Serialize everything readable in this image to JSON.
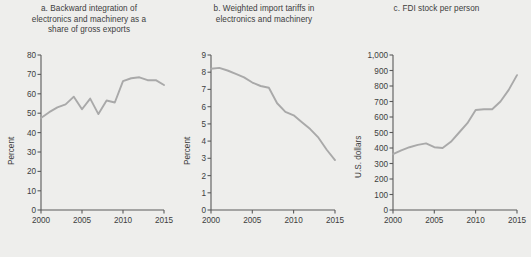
{
  "figure": {
    "background_color": "#eeeeec",
    "line_color": "#a9a9a9",
    "axis_color": "#5a5a5a",
    "text_color": "#3d3d3d"
  },
  "panels": [
    {
      "key": "a",
      "title": "a. Backward integration of electronics and machinery as a share of gross exports",
      "title_lines": [
        "a. Backward integration of",
        "electronics and machinery as a",
        "share of gross exports"
      ],
      "ylabel": "Percent",
      "yticks": [
        "80",
        "70",
        "60",
        "50",
        "40",
        "30",
        "20",
        "10",
        "0"
      ],
      "xticks": [
        "2000",
        "2005",
        "2010",
        "2015"
      ]
    },
    {
      "key": "b",
      "title": "b. Weighted import tariffs in electronics and machinery",
      "title_lines": [
        "b. Weighted import tariffs in",
        "electronics and machinery"
      ],
      "ylabel": "Percent",
      "yticks": [
        "9",
        "8",
        "7",
        "6",
        "5",
        "4",
        "3",
        "2",
        "1",
        "0"
      ],
      "xticks": [
        "2000",
        "2005",
        "2010",
        "2015"
      ]
    },
    {
      "key": "c",
      "title": "c. FDI stock per person",
      "title_lines": [
        "c. FDI stock per person"
      ],
      "ylabel": "U.S. dollars",
      "yticks": [
        "1,000",
        "900",
        "800",
        "700",
        "600",
        "500",
        "400",
        "300",
        "200",
        "100",
        "0"
      ],
      "xticks": [
        "2000",
        "2005",
        "2010",
        "2015"
      ]
    }
  ],
  "chart_data": [
    {
      "type": "line",
      "title": "a. Backward integration of electronics and machinery as a share of gross exports",
      "xlabel": "",
      "ylabel": "Percent",
      "ylim": [
        0,
        80
      ],
      "xlim": [
        2000,
        2015
      ],
      "ytick_step": 10,
      "xticks": [
        2000,
        2005,
        2010,
        2015
      ],
      "grid": false,
      "legend": "none",
      "x": [
        2000,
        2001,
        2002,
        2003,
        2004,
        2005,
        2006,
        2007,
        2008,
        2009,
        2010,
        2011,
        2012,
        2013,
        2014,
        2015
      ],
      "series": [
        {
          "name": "Backward integration share",
          "values": [
            47.5,
            50.5,
            53.0,
            54.5,
            58.5,
            52.0,
            57.5,
            49.5,
            56.5,
            55.5,
            66.5,
            68.0,
            68.5,
            67.0,
            67.0,
            64.5
          ]
        }
      ]
    },
    {
      "type": "line",
      "title": "b. Weighted import tariffs in electronics and machinery",
      "xlabel": "",
      "ylabel": "Percent",
      "ylim": [
        0,
        9
      ],
      "xlim": [
        2000,
        2015
      ],
      "ytick_step": 1,
      "xticks": [
        2000,
        2005,
        2010,
        2015
      ],
      "grid": false,
      "legend": "none",
      "x": [
        2000,
        2001,
        2002,
        2003,
        2004,
        2005,
        2006,
        2007,
        2008,
        2009,
        2010,
        2011,
        2012,
        2013,
        2014,
        2015
      ],
      "series": [
        {
          "name": "Weighted import tariff",
          "values": [
            8.2,
            8.25,
            8.1,
            7.9,
            7.7,
            7.4,
            7.2,
            7.1,
            6.2,
            5.7,
            5.5,
            5.1,
            4.7,
            4.2,
            3.5,
            2.9
          ]
        }
      ]
    },
    {
      "type": "line",
      "title": "c. FDI stock per person",
      "xlabel": "",
      "ylabel": "U.S. dollars",
      "ylim": [
        0,
        1000
      ],
      "xlim": [
        2000,
        2015
      ],
      "ytick_step": 100,
      "xticks": [
        2000,
        2005,
        2010,
        2015
      ],
      "grid": false,
      "legend": "none",
      "x": [
        2000,
        2001,
        2002,
        2003,
        2004,
        2005,
        2006,
        2007,
        2008,
        2009,
        2010,
        2011,
        2012,
        2013,
        2014,
        2015
      ],
      "series": [
        {
          "name": "FDI stock per person",
          "values": [
            360,
            385,
            405,
            420,
            430,
            405,
            400,
            440,
            500,
            560,
            645,
            650,
            650,
            700,
            775,
            870
          ]
        }
      ]
    }
  ]
}
